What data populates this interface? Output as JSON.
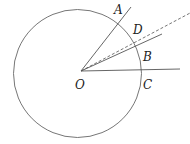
{
  "diagram": {
    "type": "geometry",
    "circle": {
      "cx": 77.5,
      "cy": 73.5,
      "r": 64
    },
    "center": {
      "name": "O",
      "x": 81,
      "y": 71
    },
    "rays": [
      {
        "name": "OA",
        "to": [
          131,
          7
        ],
        "style": "solid"
      },
      {
        "name": "OD",
        "to": [
          192,
          12
        ],
        "style": "dashed"
      },
      {
        "name": "OB",
        "to": [
          162,
          34
        ],
        "style": "solid"
      },
      {
        "name": "OC",
        "to": [
          180,
          69
        ],
        "style": "solid"
      }
    ],
    "labels": {
      "A": "A",
      "D": "D",
      "B": "B",
      "O": "O",
      "C": "C"
    },
    "stroke_color": "#555555"
  }
}
